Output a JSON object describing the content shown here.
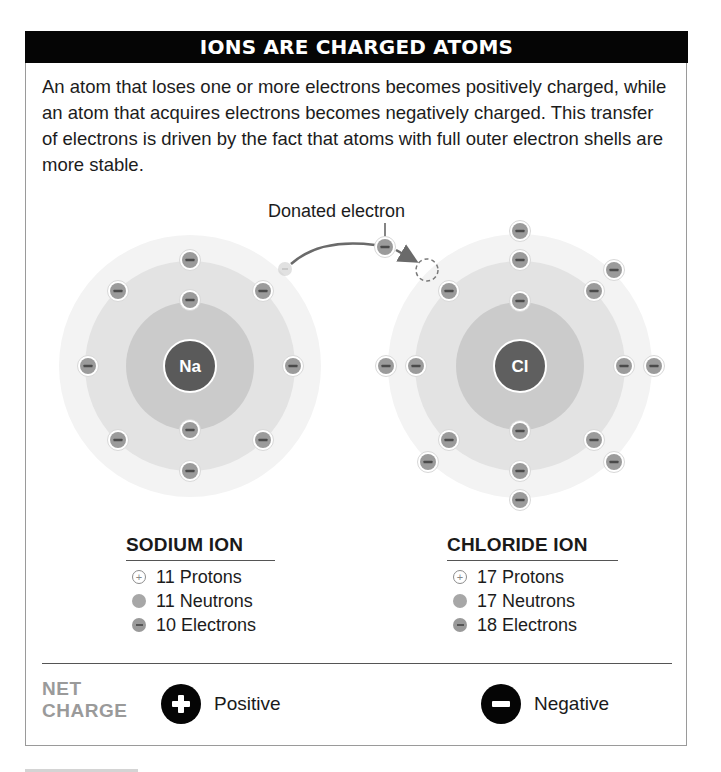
{
  "header": {
    "title": "IONS ARE CHARGED ATOMS"
  },
  "intro": {
    "text": "An atom that loses one or more electrons becomes positively charged, while an atom that acquires electrons becomes negatively charged. This transfer of electrons is driven by the fact that atoms with full outer electron shells are more stable."
  },
  "diagram": {
    "donated_label": "Donated electron",
    "sodium": {
      "symbol": "Na",
      "center": [
        190,
        366
      ]
    },
    "chlorine": {
      "symbol": "Cl",
      "center": [
        520,
        366
      ]
    },
    "colors": {
      "outer_shell": "#f1f1f1",
      "middle_shell": "#e0e0e0",
      "inner_shell": "#c9c9c9",
      "nucleus": "#5a5a5a",
      "electron": "#9b9b9b",
      "header_bg": "#050505"
    }
  },
  "sodium_ion": {
    "title": "SODIUM ION",
    "items": [
      {
        "icon": "proton-icon",
        "label": "11 Protons"
      },
      {
        "icon": "neutron-icon",
        "label": "11 Neutrons"
      },
      {
        "icon": "electron-icon",
        "label": "10 Electrons"
      }
    ]
  },
  "chloride_ion": {
    "title": "CHLORIDE ION",
    "items": [
      {
        "icon": "proton-icon",
        "label": "17 Protons"
      },
      {
        "icon": "neutron-icon",
        "label": "17 Neutrons"
      },
      {
        "icon": "electron-icon",
        "label": "18 Electrons"
      }
    ]
  },
  "net_charge": {
    "label_line1": "NET",
    "label_line2": "CHARGE",
    "positive": {
      "icon": "plus-icon",
      "label": "Positive"
    },
    "negative": {
      "icon": "minus-icon",
      "label": "Negative"
    }
  }
}
